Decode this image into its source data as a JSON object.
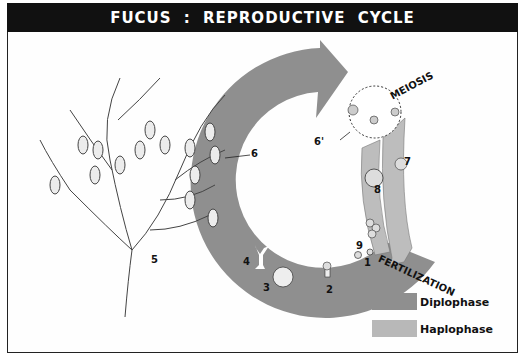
{
  "title": "FUCUS :  REPRODUCTIVE CYCLE",
  "labels": {
    "meiosis": "MEIOSIS",
    "fertilization": "FERTILIZATION",
    "stage_1": "1",
    "stage_2": "2",
    "stage_3": "3",
    "stage_4": "4",
    "stage_5": "5",
    "stage_6": "6",
    "stage_6_prime": "6'",
    "stage_7": "7",
    "stage_8": "8",
    "stage_9": "9"
  },
  "legend": [
    {
      "label": "Diplophase",
      "color": "#8f8f8f"
    },
    {
      "label": "Haplophase",
      "color": "#b8b8b8"
    }
  ],
  "colors": {
    "title_bg": "#111111",
    "diplophase": "#8f8f8f",
    "haplophase": "#bdbdbd",
    "plant_fill": "#ececec"
  }
}
